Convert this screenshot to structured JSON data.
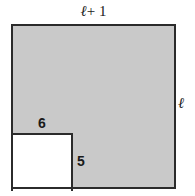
{
  "figure": {
    "type": "geometry-diagram",
    "colors": {
      "shaded_fill": "#c9c9c9",
      "notch_fill": "#ffffff",
      "stroke": "#2b2b2b",
      "background": "#ffffff",
      "text": "#1a1a1a"
    },
    "shapes": {
      "outer_square": {
        "name": "shaded-square",
        "fill": "#c9c9c9",
        "x": 11,
        "y": 24,
        "width": 165,
        "height": 165
      },
      "notch_rectangle": {
        "name": "white-notch-rectangle",
        "fill": "#ffffff",
        "x": 11,
        "y": 133,
        "width": 62,
        "height": 56
      }
    },
    "labels": {
      "top": {
        "symbol": "ℓ",
        "operator": "+ 1",
        "full": "ℓ + 1",
        "position": "above top edge of square",
        "describes": "width of outer square"
      },
      "right": {
        "symbol": "ℓ",
        "full": "ℓ",
        "position": "right of right edge of square",
        "describes": "height of outer square"
      },
      "notch_width": {
        "value": "6",
        "position": "above top edge of white notch",
        "describes": "width of white notch rectangle"
      },
      "notch_height": {
        "value": "5",
        "position": "right of right edge of white notch",
        "describes": "height of white notch rectangle"
      }
    }
  }
}
